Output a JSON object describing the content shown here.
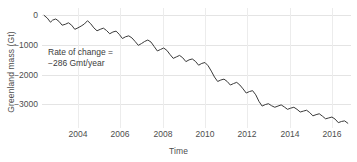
{
  "chart_data": {
    "type": "line",
    "title": "",
    "subtitle": "",
    "xlabel": "Time",
    "ylabel": "Greenland mass (Gt)",
    "xlim": [
      2002.3,
      2016.9
    ],
    "ylim": [
      -3800,
      250
    ],
    "xticks": [
      2004,
      2006,
      2008,
      2010,
      2012,
      2014,
      2016
    ],
    "xtick_labels": [
      "2004",
      "2006",
      "2008",
      "2010",
      "2012",
      "2014",
      "2016"
    ],
    "yticks": [
      0,
      -1000,
      -2000,
      -3000
    ],
    "ytick_labels": [
      "0",
      "−1000",
      "−2000",
      "−3000"
    ],
    "grid": true,
    "grid_axis": "both",
    "legend": "none",
    "line_color": "#3a3a3a",
    "grid_color": "#e4e4e4",
    "text_color": "#4d4d4d",
    "background_color": "#ffffff",
    "annotations": [
      {
        "name": "rate-of-change",
        "line1": "Rate of change =",
        "line2": "−286 Gmt/year",
        "x": 2003.2,
        "y": -1400
      }
    ],
    "series": [
      {
        "name": "Greenland mass anomaly",
        "units": "Gt",
        "x": [
          2002.4,
          2002.55,
          2002.7,
          2002.8,
          2002.95,
          2003.1,
          2003.25,
          2003.4,
          2003.55,
          2003.7,
          2003.85,
          2004.0,
          2004.15,
          2004.3,
          2004.45,
          2004.6,
          2004.75,
          2004.9,
          2005.05,
          2005.2,
          2005.35,
          2005.5,
          2005.65,
          2005.8,
          2005.95,
          2006.1,
          2006.25,
          2006.4,
          2006.55,
          2006.7,
          2006.85,
          2007.0,
          2007.15,
          2007.3,
          2007.45,
          2007.6,
          2007.75,
          2007.9,
          2008.05,
          2008.2,
          2008.35,
          2008.5,
          2008.65,
          2008.8,
          2008.95,
          2009.1,
          2009.25,
          2009.4,
          2009.55,
          2009.7,
          2009.85,
          2010.0,
          2010.15,
          2010.3,
          2010.45,
          2010.6,
          2010.75,
          2010.9,
          2011.05,
          2011.2,
          2011.35,
          2011.5,
          2011.65,
          2011.8,
          2011.95,
          2012.1,
          2012.25,
          2012.4,
          2012.55,
          2012.7,
          2012.85,
          2013.0,
          2013.15,
          2013.3,
          2013.45,
          2013.6,
          2013.75,
          2013.9,
          2014.05,
          2014.2,
          2014.35,
          2014.5,
          2014.65,
          2014.8,
          2014.95,
          2015.1,
          2015.25,
          2015.4,
          2015.55,
          2015.7,
          2015.85,
          2016.0,
          2016.15,
          2016.3,
          2016.45,
          2016.6,
          2016.75
        ],
        "y": [
          0,
          -90,
          -230,
          -160,
          -120,
          -200,
          -330,
          -300,
          -250,
          -330,
          -470,
          -420,
          -360,
          -290,
          -180,
          -280,
          -420,
          -520,
          -470,
          -430,
          -510,
          -620,
          -560,
          -530,
          -640,
          -780,
          -720,
          -690,
          -760,
          -880,
          -1010,
          -950,
          -880,
          -830,
          -900,
          -1050,
          -1200,
          -1150,
          -1100,
          -1180,
          -1320,
          -1450,
          -1400,
          -1350,
          -1430,
          -1560,
          -1500,
          -1470,
          -1550,
          -1680,
          -1620,
          -1590,
          -1700,
          -1880,
          -2080,
          -2230,
          -2180,
          -2150,
          -2230,
          -2350,
          -2300,
          -2260,
          -2350,
          -2480,
          -2620,
          -2570,
          -2540,
          -2680,
          -2900,
          -3060,
          -3010,
          -2980,
          -3050,
          -3100,
          -3060,
          -3020,
          -3090,
          -3170,
          -3130,
          -3100,
          -3170,
          -3260,
          -3230,
          -3200,
          -3280,
          -3390,
          -3350,
          -3320,
          -3400,
          -3490,
          -3460,
          -3430,
          -3500,
          -3620,
          -3580,
          -3560,
          -3640
        ]
      }
    ]
  }
}
